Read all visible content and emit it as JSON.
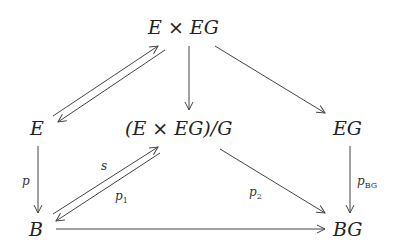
{
  "diagram": {
    "type": "commutative-diagram",
    "nodes": {
      "top": "E × EG",
      "left": "E",
      "center": "(E × EG)/G",
      "right": "EG",
      "bottom_left": "B",
      "bottom_right": "BG"
    },
    "labels": {
      "p": "p",
      "s": "s",
      "p1_base": "p",
      "p1_sub": "1",
      "p2_base": "p",
      "p2_sub": "2",
      "pBG_base": "p",
      "pBG_sub": "BG"
    },
    "edges": [
      {
        "from": "left",
        "to": "top",
        "label": ""
      },
      {
        "from": "top",
        "to": "left",
        "label": ""
      },
      {
        "from": "top",
        "to": "center",
        "label": ""
      },
      {
        "from": "top",
        "to": "right",
        "label": ""
      },
      {
        "from": "left",
        "to": "bottom_left",
        "label": "p"
      },
      {
        "from": "bottom_left",
        "to": "center",
        "label": "s"
      },
      {
        "from": "center",
        "to": "bottom_left",
        "label": "p1"
      },
      {
        "from": "center",
        "to": "bottom_right",
        "label": "p2"
      },
      {
        "from": "right",
        "to": "bottom_right",
        "label": "pBG"
      },
      {
        "from": "bottom_left",
        "to": "bottom_right",
        "label": ""
      }
    ]
  }
}
